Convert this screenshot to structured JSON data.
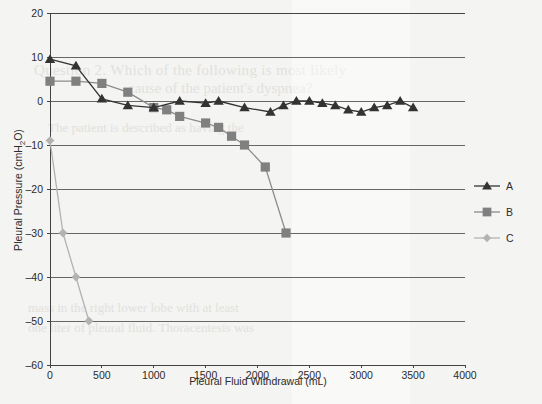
{
  "chart_data": {
    "type": "line",
    "title": "",
    "xlabel": "Pleural Fluid Withdrawal (mL)",
    "ylabel": "Pleural Pressure (cmH2O)",
    "ylabel_parts": {
      "pre": "Pleural Pressure (cmH",
      "sub": "2",
      "post": "O)"
    },
    "xlim": [
      0,
      4000
    ],
    "ylim": [
      -60,
      20
    ],
    "xticks": [
      0,
      500,
      1000,
      1500,
      2000,
      2500,
      3000,
      3500,
      4000
    ],
    "yticks": [
      20,
      10,
      0,
      -10,
      -20,
      -30,
      -40,
      -50,
      -60
    ],
    "xtick_labels": [
      "0",
      "500",
      "1000",
      "1500",
      "2000",
      "2500",
      "3000",
      "3500",
      "4000"
    ],
    "ytick_labels": [
      "20",
      "10",
      "0",
      "–10",
      "–20",
      "–30",
      "–40",
      "–50",
      "–60"
    ],
    "grid": "horizontal",
    "legend_position": "right",
    "series": [
      {
        "name": "A",
        "marker": "triangle",
        "color": "#333333",
        "line_color": "#333333",
        "x": [
          0,
          250,
          500,
          750,
          1000,
          1250,
          1500,
          1625,
          1875,
          2125,
          2250,
          2375,
          2500,
          2625,
          2750,
          2875,
          3000,
          3125,
          3250,
          3375,
          3500
        ],
        "y": [
          9.5,
          8,
          0.5,
          -1,
          -1.5,
          0,
          -0.5,
          0,
          -1.5,
          -2.5,
          -1,
          0,
          0,
          -0.5,
          -1,
          -2,
          -2.5,
          -1.5,
          -1,
          0,
          -1.5
        ]
      },
      {
        "name": "B",
        "marker": "square",
        "color": "#808080",
        "line_color": "#8c8c8c",
        "x": [
          0,
          250,
          500,
          750,
          1000,
          1125,
          1250,
          1500,
          1625,
          1750,
          1875,
          2075,
          2275
        ],
        "y": [
          4.5,
          4.5,
          4,
          2,
          -1.5,
          -2,
          -3.5,
          -5,
          -6,
          -8,
          -10,
          -15,
          -30
        ]
      },
      {
        "name": "C",
        "marker": "diamond",
        "color": "#b3b3b3",
        "line_color": "#b3b3b3",
        "x": [
          0,
          125,
          250,
          375
        ],
        "y": [
          -9,
          -30,
          -40,
          -50
        ]
      }
    ]
  },
  "legend": {
    "items": [
      {
        "label": "A"
      },
      {
        "label": "B"
      },
      {
        "label": "C"
      }
    ]
  },
  "colors": {
    "background": "#f4f4f2",
    "axis": "#444444",
    "grid": "#666666",
    "series_a": "#333333",
    "series_b": "#808080",
    "series_c": "#b3b3b3"
  },
  "bleed_text": {
    "lines": [
      "Question 2. Which of the following is most likely",
      "cause of the patient's dyspnea?",
      "The patient is described as having the",
      "mass in the right lower lobe with at least",
      "one liter of pleural fluid. Thoracentesis was"
    ]
  }
}
